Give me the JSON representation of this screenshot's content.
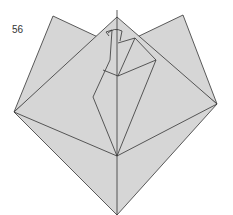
{
  "diagram": {
    "type": "origami-step",
    "step_number": "56",
    "colors": {
      "paper": "#d4d4d4",
      "paper_light": "#dcdcdc",
      "line": "#333333",
      "background": "#ffffff"
    }
  }
}
